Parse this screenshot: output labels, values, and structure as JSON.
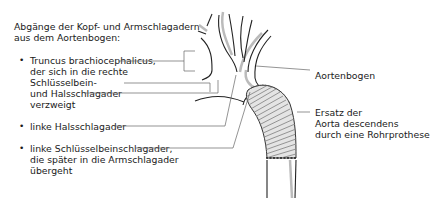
{
  "title": {
    "line1": "Abgänge der Kopf- und Armschlagadern",
    "line2": "aus dem Aortenbogen:"
  },
  "branches": [
    {
      "lines": [
        "Truncus brachiocephalicus,",
        "der sich in die rechte",
        "Schlüsselbein-",
        "und Halsschlagader",
        "verzweigt"
      ]
    },
    {
      "lines": [
        "linke Halsschlagader"
      ]
    },
    {
      "lines": [
        "linke Schlüsselbeinschlagader,",
        "die später in die Armschlagader",
        "übergeht"
      ]
    }
  ],
  "labels": {
    "arch": "Aortenbogen",
    "prosthesis": [
      "Ersatz der",
      "Aorta descendens",
      "durch eine Rohrprothese"
    ]
  },
  "bullet_char": "•",
  "colors": {
    "line": "#333333",
    "shade": "#bbbbbb",
    "prosthesis": "#a8a8a8"
  }
}
